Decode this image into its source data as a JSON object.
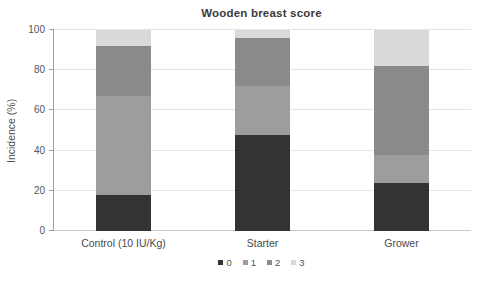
{
  "chart_data": {
    "type": "bar",
    "stacked": true,
    "title": "Wooden breast score",
    "ylabel": "Incidence (%)",
    "xlabel": "",
    "categories": [
      "Control (10 IU/Kg)",
      "Starter",
      "Grower"
    ],
    "series": [
      {
        "name": "0",
        "color": "#333333",
        "texture": "striped",
        "values": [
          18,
          48,
          24
        ]
      },
      {
        "name": "1",
        "color": "#9d9d9d",
        "texture": "striped",
        "values": [
          49,
          24,
          14
        ]
      },
      {
        "name": "2",
        "color": "#8a8a8a",
        "texture": "solid",
        "values": [
          25,
          24,
          44
        ]
      },
      {
        "name": "3",
        "color": "#d9d9d9",
        "texture": "striped",
        "values": [
          8,
          4,
          18
        ]
      }
    ],
    "ylim": [
      0,
      100
    ],
    "yticks": [
      0,
      20,
      40,
      60,
      80,
      100
    ],
    "grid": true,
    "legend_position": "bottom",
    "colors": {
      "title_text": "#3a3a3a",
      "axis_text": "#4f4f4f",
      "gridline": "#e4e4e4",
      "axis_line": "#9f9f9f",
      "background": "#ffffff"
    }
  }
}
